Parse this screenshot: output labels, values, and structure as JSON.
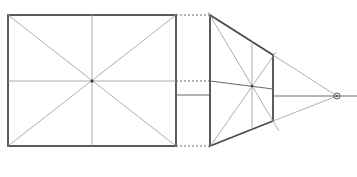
{
  "diagram": {
    "type": "perspective-projection-sketch",
    "colors": {
      "background": "#ffffff",
      "line_dark": "#4a4a4a",
      "line_light": "#9a9a9a"
    },
    "front_rectangle": {
      "x1": 8,
      "y1": 15,
      "x2": 176,
      "y2": 146,
      "center": [
        92,
        81
      ]
    },
    "trapezoid": {
      "points": [
        [
          210,
          15
        ],
        [
          273,
          55
        ],
        [
          273,
          121
        ],
        [
          210,
          146
        ]
      ],
      "center": [
        252,
        86
      ]
    },
    "vanishing_point": {
      "x": 337,
      "y": 96,
      "r": 3
    },
    "connector_y": 95,
    "midline_y": 81
  }
}
